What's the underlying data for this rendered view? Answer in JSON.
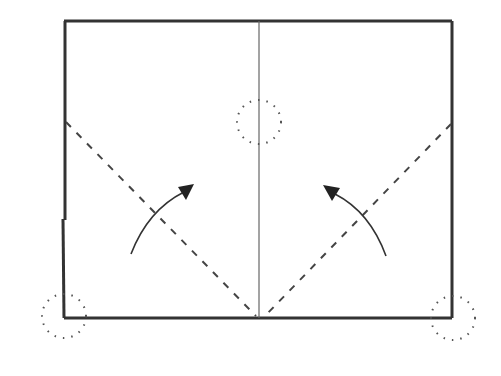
{
  "diagram": {
    "type": "folding-instruction",
    "colors": {
      "outline": "#333333",
      "crease": "#555555",
      "dashed": "#444444",
      "dotted": "#555555",
      "arrow": "#333333",
      "background": "#ffffff"
    },
    "paper": {
      "x1": 64,
      "y1": 21,
      "x2": 452,
      "y2": 318
    },
    "center_crease": {
      "x": 259
    },
    "fold_lines": [
      {
        "name": "left-diagonal",
        "from": [
          64,
          122
        ],
        "to": [
          256,
          317
        ]
      },
      {
        "name": "right-diagonal",
        "from": [
          451,
          124
        ],
        "to": [
          265,
          317
        ]
      }
    ],
    "arrows": [
      {
        "name": "left-fold-arrow",
        "direction": "up-right"
      },
      {
        "name": "right-fold-arrow",
        "direction": "up-left"
      }
    ],
    "target_marks": [
      {
        "name": "center-target-circle",
        "cx": 259,
        "cy": 122,
        "r": 22
      },
      {
        "name": "bottom-left-corner-circle",
        "cx": 63,
        "cy": 316,
        "r": 23
      },
      {
        "name": "bottom-right-corner-circle",
        "cx": 453,
        "cy": 318,
        "r": 23
      }
    ]
  }
}
